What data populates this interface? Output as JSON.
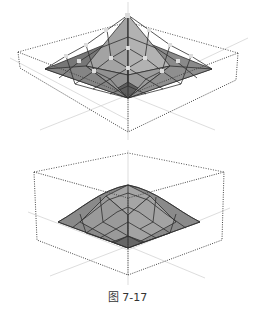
{
  "figures": [
    {
      "name": "top-surface-with-control-points",
      "description": "3D surface peak with control points in dotted bounding box"
    },
    {
      "name": "bottom-smooth-surface",
      "description": "Smoothed 3D surface peak in dotted bounding box"
    }
  ],
  "caption": "图 7-17",
  "colors": {
    "surface_light": "#a9a9a9",
    "surface_dark": "#6e6e6e",
    "grid": "#2e2e2e",
    "box": "#444444",
    "control_point": "#d8d8d8"
  }
}
